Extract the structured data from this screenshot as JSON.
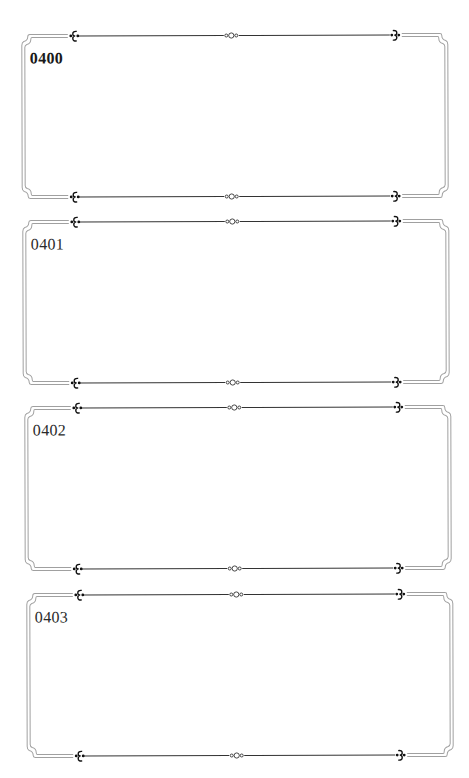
{
  "cards": [
    {
      "label": "0400",
      "bold": true
    },
    {
      "label": "0401",
      "bold": false
    },
    {
      "label": "0402",
      "bold": false
    },
    {
      "label": "0403",
      "bold": false
    }
  ],
  "colors": {
    "frame_line": "#9a9a9a",
    "ornament": "#1a1a1a",
    "rule": "#333333"
  },
  "ornaments": {
    "left": "fleur-scroll-left",
    "center": "triple-circle",
    "right": "fleur-scroll-right"
  }
}
